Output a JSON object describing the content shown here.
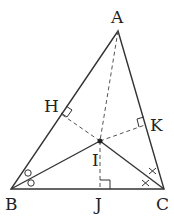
{
  "diagram": {
    "type": "geometry-triangle-incenter",
    "points": {
      "A": {
        "label": "A",
        "x": 118,
        "y": 31
      },
      "B": {
        "label": "B",
        "x": 11,
        "y": 189
      },
      "C": {
        "label": "C",
        "x": 164,
        "y": 189
      },
      "I": {
        "label": "I",
        "x": 100,
        "y": 141
      },
      "H": {
        "label": "H",
        "x": 61,
        "y": 114
      },
      "K": {
        "label": "K",
        "x": 145,
        "y": 125
      },
      "J": {
        "label": "J",
        "x": 100,
        "y": 189
      }
    },
    "solid_segments": [
      "AB",
      "BC",
      "CA",
      "BI",
      "CI"
    ],
    "dashed_segments": [
      "AI",
      "IH",
      "IK",
      "IJ"
    ],
    "right_angles": [
      "H",
      "K",
      "J"
    ],
    "angle_marks": {
      "B": "circles",
      "C": "crosses"
    },
    "line_color": "#333333"
  }
}
